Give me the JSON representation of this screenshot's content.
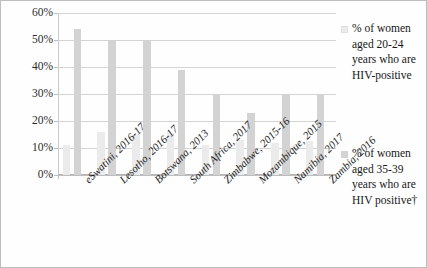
{
  "chart_data": {
    "type": "bar",
    "title": "",
    "subtitle": "",
    "xlabel": "",
    "ylabel": "",
    "ylim": [
      0,
      60
    ],
    "ytick_step": 10,
    "grid": true,
    "legend_position": "right",
    "categories": [
      "eSwatini, 2016-17",
      "Lesotho, 2016-17",
      "Botswana, 2013",
      "South Africa, 2017",
      "Zimbabwe, 2015-16",
      "Mozambique, 2015",
      "Namibia, 2017",
      "Zambia, 2016"
    ],
    "series": [
      {
        "name": "% of women aged 20-24 years who are HIV-positive",
        "color": "#ebebeb",
        "values": [
          11,
          16,
          15,
          15.5,
          11,
          13,
          12,
          12.5
        ]
      },
      {
        "name": "% of women aged 35-39 years who are HIV positive†",
        "color": "#d3d3d3",
        "values": [
          54,
          50,
          50,
          39,
          30,
          23,
          30,
          30
        ]
      }
    ],
    "ytick_labels": [
      "60%",
      "50%",
      "40%",
      "30%",
      "20%",
      "10%",
      "0%"
    ],
    "ytick_values": [
      60,
      50,
      40,
      30,
      20,
      10,
      0
    ]
  },
  "legend": {
    "entries": [
      {
        "swatch_name": "legend-swatch-light",
        "label": "% of women aged 20-24 years who are HIV-positive"
      },
      {
        "swatch_name": "legend-swatch-dark",
        "label": "% of women aged 35-39 years who are HIV positive†"
      }
    ]
  },
  "colors": {
    "series_light": "#ebebeb",
    "series_dark": "#d3d3d3",
    "gridline": "#d4d4d4",
    "axis": "#bdbdbd",
    "text": "#1b1b1b",
    "background": "#fefefe",
    "border": "#bdbdbd"
  }
}
